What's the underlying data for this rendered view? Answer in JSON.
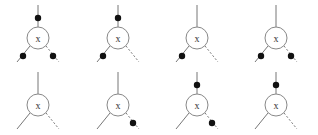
{
  "diagram": {
    "node_label": "x",
    "colors": {
      "line": "#777777",
      "dot": "#111111",
      "circle": "#888888"
    },
    "vertices": [
      {
        "id": "v1",
        "row": 0,
        "col": 0,
        "label": "x",
        "dots": {
          "top": true,
          "left": true,
          "right": true
        }
      },
      {
        "id": "v2",
        "row": 0,
        "col": 1,
        "label": "x",
        "dots": {
          "top": true,
          "left": true,
          "right": false
        }
      },
      {
        "id": "v3",
        "row": 0,
        "col": 2,
        "label": "x",
        "dots": {
          "top": false,
          "left": true,
          "right": false
        }
      },
      {
        "id": "v4",
        "row": 0,
        "col": 3,
        "label": "x",
        "dots": {
          "top": false,
          "left": true,
          "right": true
        }
      },
      {
        "id": "v5",
        "row": 1,
        "col": 0,
        "label": "x",
        "dots": {
          "top": false,
          "left": false,
          "right": false
        }
      },
      {
        "id": "v6",
        "row": 1,
        "col": 1,
        "label": "x",
        "dots": {
          "top": false,
          "left": false,
          "right": true
        }
      },
      {
        "id": "v7",
        "row": 1,
        "col": 2,
        "label": "x",
        "dots": {
          "top": true,
          "left": false,
          "right": true
        }
      },
      {
        "id": "v8",
        "row": 1,
        "col": 3,
        "label": "x",
        "dots": {
          "top": true,
          "left": false,
          "right": false
        }
      }
    ]
  }
}
